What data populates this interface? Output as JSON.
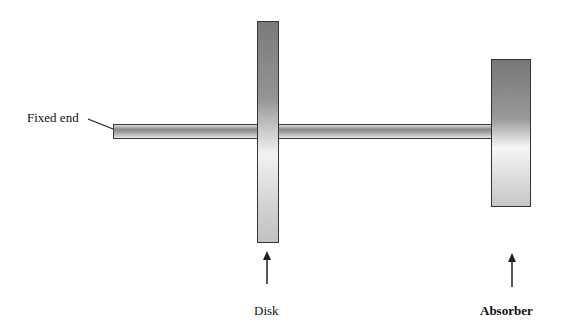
{
  "diagram": {
    "type": "mechanical-schematic",
    "labels": {
      "fixed_end": "Fixed end",
      "disk": "Disk",
      "absorber": "Absorber"
    },
    "components": [
      {
        "name": "shaft",
        "from": "fixed end",
        "to": "absorber"
      },
      {
        "name": "disk",
        "position": "mid-shaft"
      },
      {
        "name": "absorber",
        "position": "shaft end"
      }
    ],
    "colors": {
      "outline": "#333333",
      "fill_dark": "#7a7a7a",
      "fill_light": "#f2f2f2",
      "text": "#111111"
    }
  }
}
